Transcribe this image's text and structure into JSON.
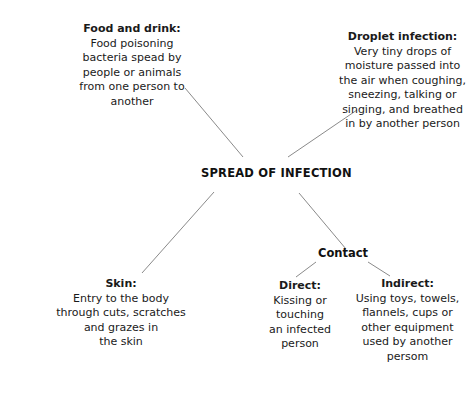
{
  "diagram": {
    "title": "SPREAD OF INFECTION",
    "center": {
      "label": "SPREAD OF INFECTION"
    },
    "branch_label": {
      "contact": "Contact"
    },
    "nodes": [
      {
        "id": "food-and-drink",
        "title": "Food and drink:",
        "body": "Food poisoning\nbacteria spead by\npeople or animals\nfrom one person to\nanother"
      },
      {
        "id": "droplet-infection",
        "title": "Droplet infection:",
        "body": "Very tiny drops of\nmoisture passed into\nthe air when coughing,\nsneezing, talking or\nsinging, and breathed\nin by another person"
      },
      {
        "id": "skin",
        "title": "Skin:",
        "body": "Entry to the body\nthrough cuts, scratches\nand grazes in\nthe skin"
      },
      {
        "id": "direct",
        "title": "Direct:",
        "body": "Kissing or\ntouching\nan infected\nperson"
      },
      {
        "id": "indirect",
        "title": "Indirect:",
        "body": "Using toys, towels,\nflannels, cups or\nother equipment\nused by another\npersom"
      }
    ],
    "connectors": [
      {
        "id": "food-to-center",
        "from": "food-and-drink",
        "to": "center",
        "x1": 185,
        "y1": 88,
        "x2": 243,
        "y2": 157
      },
      {
        "id": "droplet-to-center",
        "from": "droplet-infection",
        "to": "center",
        "x1": 357,
        "y1": 110,
        "x2": 288,
        "y2": 157
      },
      {
        "id": "center-to-skin",
        "from": "center",
        "to": "skin",
        "x1": 214,
        "y1": 192,
        "x2": 142,
        "y2": 273
      },
      {
        "id": "center-to-contact",
        "from": "center",
        "to": "contact",
        "x1": 299,
        "y1": 193,
        "x2": 346,
        "y2": 249
      },
      {
        "id": "contact-to-direct",
        "from": "contact",
        "to": "direct",
        "x1": 316,
        "y1": 262,
        "x2": 296,
        "y2": 277
      },
      {
        "id": "contact-to-indirect",
        "from": "contact",
        "to": "indirect",
        "x1": 368,
        "y1": 262,
        "x2": 390,
        "y2": 276
      }
    ],
    "colors": {
      "background": "#ffffff",
      "text": "#1a1a1a",
      "line": "#8a8a8a"
    }
  }
}
